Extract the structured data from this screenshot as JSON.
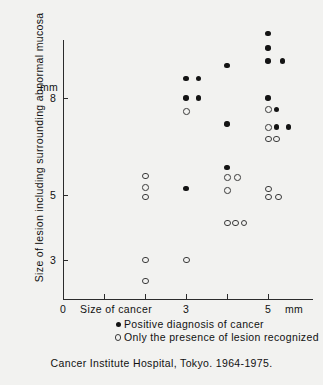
{
  "chart_data": {
    "type": "scatter",
    "title": "",
    "xlabel": "Size of cancer",
    "ylabel": "Size of lesion including surrounding abnormal mucosa",
    "x_unit": "mm",
    "y_unit": "mm",
    "xlim": [
      0,
      6.1
    ],
    "ylim": [
      0,
      10.2
    ],
    "grid": false,
    "x_ticks": [
      {
        "value": 0,
        "label": "0"
      },
      {
        "value": 1,
        "label": ""
      },
      {
        "value": 2,
        "label": ""
      },
      {
        "value": 3,
        "label": "3"
      },
      {
        "value": 4,
        "label": ""
      },
      {
        "value": 5,
        "label": "5"
      }
    ],
    "y_ticks": [
      {
        "value": 8,
        "label": "8"
      },
      {
        "value": 5,
        "label": "5"
      },
      {
        "value": 3,
        "label": "3"
      }
    ],
    "legend_position": "below-axes",
    "series": [
      {
        "name": "Positive diagnosis of cancer",
        "marker": "filled-circle",
        "color": "#141414",
        "points": [
          [
            3,
            8.6
          ],
          [
            3.3,
            8.6
          ],
          [
            3,
            8.0
          ],
          [
            3.3,
            8.0
          ],
          [
            3,
            5.2
          ],
          [
            4,
            9.0
          ],
          [
            4,
            7.2
          ],
          [
            4,
            5.85
          ],
          [
            5,
            10.0
          ],
          [
            5,
            9.55
          ],
          [
            5,
            9.15
          ],
          [
            5.35,
            9.15
          ],
          [
            5,
            8.0
          ],
          [
            5.2,
            7.65
          ],
          [
            5.2,
            7.1
          ],
          [
            5.5,
            7.1
          ]
        ]
      },
      {
        "name": "Only the presence of lesion recognized",
        "marker": "open-circle",
        "color": "#3a3a3a",
        "points": [
          [
            2,
            5.6
          ],
          [
            2,
            5.25
          ],
          [
            2,
            4.95
          ],
          [
            2,
            3.0
          ],
          [
            2,
            2.35
          ],
          [
            3,
            7.6
          ],
          [
            3,
            3.0
          ],
          [
            4,
            5.55
          ],
          [
            4.25,
            5.55
          ],
          [
            4,
            5.15
          ],
          [
            4,
            4.15
          ],
          [
            4.2,
            4.15
          ],
          [
            4.4,
            4.15
          ],
          [
            5,
            7.65
          ],
          [
            5,
            7.1
          ],
          [
            5,
            6.75
          ],
          [
            5.2,
            6.75
          ],
          [
            5,
            5.2
          ],
          [
            5,
            4.95
          ],
          [
            5.25,
            4.95
          ]
        ]
      }
    ],
    "legend": [
      {
        "marker": "filled-circle",
        "label": "Positive diagnosis of cancer"
      },
      {
        "marker": "open-circle",
        "label": "Only the presence of lesion recognized"
      }
    ],
    "caption": "Cancer Institute Hospital, Tokyo. 1964-1975."
  }
}
